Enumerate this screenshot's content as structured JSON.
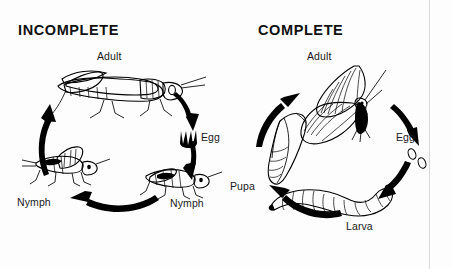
{
  "figure": {
    "kind": "insect-metamorphosis-comparison-diagram",
    "background_color": "#fdfdfd",
    "ink_color": "#000000"
  },
  "panels": [
    {
      "id": "incomplete",
      "title": "INCOMPLETE",
      "cycle_direction": "clockwise",
      "organism": "grasshopper",
      "stages": [
        {
          "key": "adult",
          "label": "Adult",
          "icon": "grasshopper-adult-icon"
        },
        {
          "key": "egg",
          "label": "Egg",
          "icon": "egg-cluster-icon"
        },
        {
          "key": "nymph_late",
          "label": "Nymph",
          "icon": "grasshopper-nymph-icon"
        },
        {
          "key": "nymph_early",
          "label": "Nymph",
          "icon": "grasshopper-nymph-small-icon"
        }
      ]
    },
    {
      "id": "complete",
      "title": "COMPLETE",
      "cycle_direction": "clockwise",
      "organism": "butterfly",
      "stages": [
        {
          "key": "adult",
          "label": "Adult",
          "icon": "butterfly-adult-icon"
        },
        {
          "key": "egg",
          "label": "Egg",
          "icon": "egg-pair-icon"
        },
        {
          "key": "larva",
          "label": "Larva",
          "icon": "caterpillar-larva-icon"
        },
        {
          "key": "pupa",
          "label": "Pupa",
          "icon": "chrysalis-pupa-icon"
        }
      ]
    }
  ]
}
